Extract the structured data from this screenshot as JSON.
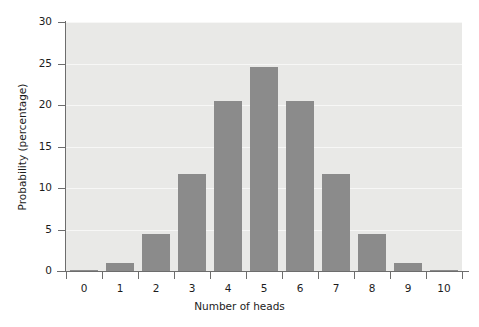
{
  "chart_data": {
    "type": "bar",
    "title": "",
    "subtitle": "",
    "xlabel": "Number of heads",
    "ylabel": "Probability (percentage)",
    "categories": [
      "0",
      "1",
      "2",
      "3",
      "4",
      "5",
      "6",
      "7",
      "8",
      "9",
      "10"
    ],
    "values": [
      0.1,
      1.0,
      4.4,
      11.7,
      20.5,
      24.6,
      20.5,
      11.7,
      4.4,
      1.0,
      0.1
    ],
    "xlim": [
      -0.5,
      10.5
    ],
    "ylim": [
      0,
      30
    ],
    "ytick_values": [
      0,
      5,
      10,
      15,
      20,
      25,
      30
    ],
    "ytick_labels": [
      "0",
      "5",
      "10",
      "15",
      "20",
      "25",
      "30"
    ],
    "xtick_labels": [
      "0",
      "1",
      "2",
      "3",
      "4",
      "5",
      "6",
      "7",
      "8",
      "9",
      "10"
    ],
    "grid": true,
    "grid_orientation": "horizontal",
    "legend": false,
    "legend_position": "none",
    "bar_color": "#8b8b8b",
    "plot_background_color": "#e9e9e7",
    "gridline_color": "#f7f7f6",
    "axis_color": "#6d6d6d",
    "text_color": "#1c1c1c"
  }
}
